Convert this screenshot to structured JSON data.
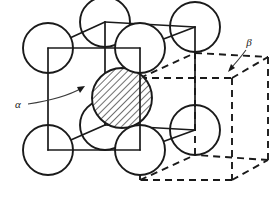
{
  "figure": {
    "canvas": {
      "width": 274,
      "height": 199,
      "background": "#ffffff"
    },
    "line_color": "#1a1a1a",
    "leader_color": "#3a3a3a"
  },
  "labels": {
    "alpha": {
      "text": "α",
      "name": "alpha-phase-label",
      "x": 18,
      "y": 108,
      "leader_path": "M 28 104 C 48 101 68 96 82 88",
      "arrow_tip": {
        "x": 85,
        "y": 86
      },
      "arrow_angle": -28
    },
    "beta": {
      "text": "β",
      "name": "beta-phase-label",
      "x": 249,
      "y": 46,
      "leader_path": "M 246 50 C 240 58 235 64 230 69",
      "arrow_tip": {
        "x": 228,
        "y": 72
      },
      "arrow_angle": 126
    }
  },
  "solid_cell": {
    "name": "alpha-unit-cell",
    "style": "solid",
    "vertices": {
      "front_top_left": {
        "x": 48,
        "y": 48
      },
      "front_top_right": {
        "x": 140,
        "y": 48
      },
      "front_bottom_right": {
        "x": 140,
        "y": 150
      },
      "front_bottom_left": {
        "x": 48,
        "y": 150
      },
      "back_top_left": {
        "x": 105,
        "y": 22
      },
      "back_top_right": {
        "x": 195,
        "y": 27
      },
      "back_bottom_right": {
        "x": 195,
        "y": 130
      },
      "back_bottom_left": {
        "x": 105,
        "y": 125
      }
    },
    "edges": [
      "M 48 48 L 140 48",
      "M 140 48 L 140 150",
      "M 140 150 L 48 150",
      "M 48 150 L 48 48",
      "M 105 22 L 195 27",
      "M 195 27 L 195 130",
      "M 195 130 L 105 125",
      "M 105 125 L 105 22",
      "M 48 48 L 105 22",
      "M 140 48 L 195 27",
      "M 140 150 L 195 130",
      "M 48 150 L 105 125"
    ]
  },
  "dashed_cell": {
    "name": "beta-unit-cell",
    "style": "dashed",
    "vertices": {
      "front_top_left": {
        "x": 140,
        "y": 78
      },
      "front_top_right": {
        "x": 232,
        "y": 78
      },
      "front_bottom_right": {
        "x": 232,
        "y": 180
      },
      "front_bottom_left": {
        "x": 140,
        "y": 180
      },
      "back_top_left": {
        "x": 195,
        "y": 53
      },
      "back_top_right": {
        "x": 268,
        "y": 57
      },
      "back_bottom_right": {
        "x": 268,
        "y": 160
      },
      "back_bottom_left": {
        "x": 195,
        "y": 155
      }
    },
    "edges": [
      "M 140 78 L 232 78",
      "M 232 78 L 232 180",
      "M 232 180 L 140 180",
      "M 140 180 L 140 78",
      "M 195 53 L 268 57",
      "M 268 57 L 268 160",
      "M 268 160 L 195 155",
      "M 195 155 L 195 53",
      "M 140 78 L 195 53",
      "M 232 78 L 268 57",
      "M 232 180 L 268 160",
      "M 140 180 L 195 155"
    ]
  },
  "spheres": {
    "radius": 25,
    "center_radius": 30,
    "corner_atoms": [
      {
        "name": "atom-front-top-left",
        "x": 48,
        "y": 48,
        "r": 25
      },
      {
        "name": "atom-front-top-right",
        "x": 140,
        "y": 48,
        "r": 25
      },
      {
        "name": "atom-front-bottom-left",
        "x": 48,
        "y": 150,
        "r": 25
      },
      {
        "name": "atom-front-bottom-right",
        "x": 140,
        "y": 150,
        "r": 25
      },
      {
        "name": "atom-back-top-left",
        "x": 105,
        "y": 22,
        "r": 25
      },
      {
        "name": "atom-back-top-right",
        "x": 195,
        "y": 27,
        "r": 25
      },
      {
        "name": "atom-back-bottom-left",
        "x": 105,
        "y": 125,
        "r": 25
      },
      {
        "name": "atom-back-bottom-right",
        "x": 195,
        "y": 130,
        "r": 25
      }
    ],
    "center_atom": {
      "name": "atom-body-center-hatched",
      "x": 122,
      "y": 98,
      "r": 30,
      "fill": "hatch",
      "hatch_angle_deg": 45,
      "hatch_spacing": 5
    }
  }
}
